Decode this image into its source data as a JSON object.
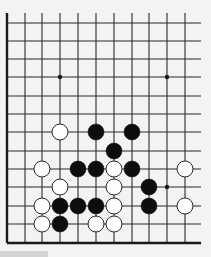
{
  "board": {
    "width": 211,
    "height": 257,
    "background": "#f3f3f3",
    "line_color": "#2a2a2a",
    "edge_color": "#1a1a1a",
    "columns_x": [
      7,
      25,
      42,
      60,
      78,
      96,
      114,
      132,
      149,
      167,
      185
    ],
    "rows_y": [
      23,
      41,
      59,
      77,
      96,
      114,
      132,
      151,
      169,
      187,
      206,
      224,
      243
    ],
    "line_top": 13,
    "line_right": 201,
    "left_edge_col": 0,
    "bottom_edge_row": 12,
    "stone_radius": 8,
    "star_points": [
      {
        "col": 3,
        "row": 3
      },
      {
        "col": 9,
        "row": 3
      },
      {
        "col": 9,
        "row": 9
      }
    ],
    "stones": [
      {
        "color": "white",
        "col": 3,
        "row": 6
      },
      {
        "color": "black",
        "col": 5,
        "row": 6
      },
      {
        "color": "black",
        "col": 7,
        "row": 6
      },
      {
        "color": "black",
        "col": 6,
        "row": 7
      },
      {
        "color": "white",
        "col": 2,
        "row": 8
      },
      {
        "color": "black",
        "col": 4,
        "row": 8
      },
      {
        "color": "black",
        "col": 5,
        "row": 8
      },
      {
        "color": "white",
        "col": 6,
        "row": 8
      },
      {
        "color": "black",
        "col": 7,
        "row": 8
      },
      {
        "color": "white",
        "col": 10,
        "row": 8
      },
      {
        "color": "white",
        "col": 3,
        "row": 9
      },
      {
        "color": "white",
        "col": 6,
        "row": 9
      },
      {
        "color": "black",
        "col": 8,
        "row": 9
      },
      {
        "color": "white",
        "col": 2,
        "row": 10
      },
      {
        "color": "black",
        "col": 3,
        "row": 10
      },
      {
        "color": "black",
        "col": 4,
        "row": 10
      },
      {
        "color": "black",
        "col": 5,
        "row": 10
      },
      {
        "color": "white",
        "col": 6,
        "row": 10
      },
      {
        "color": "black",
        "col": 8,
        "row": 10
      },
      {
        "color": "white",
        "col": 10,
        "row": 10
      },
      {
        "color": "white",
        "col": 2,
        "row": 11
      },
      {
        "color": "black",
        "col": 3,
        "row": 11
      },
      {
        "color": "white",
        "col": 5,
        "row": 11
      },
      {
        "color": "white",
        "col": 6,
        "row": 11
      }
    ],
    "stone_colors": {
      "black": "#0d0d0d",
      "white": "#ffffff",
      "white_outline": "#2a2a2a"
    }
  },
  "bottom_bar": {
    "color": "#d4d4d4"
  }
}
